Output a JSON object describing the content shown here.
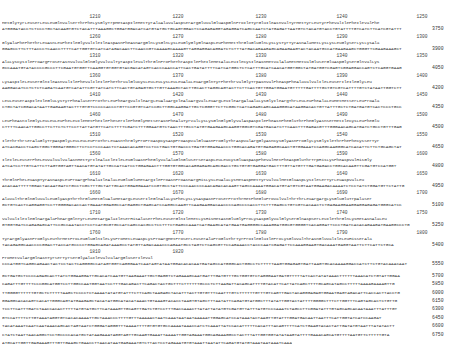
{
  "document": {
    "type": "nucleotide-and-deduced-amino-acid-sequence",
    "coding_blocks": [
      {
        "ruler": [
          "1210",
          "1220",
          "1230",
          "1240",
          "1250"
        ],
        "aa": "MetGlyTyrLeuSerLeuLeuGlnValSerThrPheLysGlyTrpMetAspIleMetTyrAlaAlaValAspSerArgGluValGluAspGlnProIleTyrGluIleAsnValTyrMetTyrLeuTyrPheValIlePheIleValPhe",
        "nt": "ATGGGATACCTCTCCCTGCTACAAGTGTCTACATTTAAAGGCTGGATGGACATCATGTATGCTGCAGTGGACTCCAGAGAGGTAGAGGATCAGCCAATCTATGAGATTAATGTCTACATGTACCTGTATTTTGTCATCTTCATCGTATTT",
        "end": "3750"
      },
      {
        "ruler": [
          "1260",
          "1270",
          "1280",
          "1290",
          "1300"
        ],
        "aa": "GlyAlaPhePheThrLeuAsnLeuPheIleGlyValIleIleAspAsnPheAsnArgGlnLysGlnLysLeuGlyGlyGlnAspLeuPheMetThrGluGluGlnLysLysTyrTyrAsnAlaMetLysLysLeuGlySerLysLysAla",
        "nt": "GGAGCCTTCTTTACCCTCAACCTTTTCATTGGTGTCATCATAGACAACTTCAACCGTCAAAAGCAAAAGTTAGGAGGACAGGATCTCTTTATGACAGAAGAGCAGAAGAAGTACTACAATGCCATGAAGAAGCTGGGTTCGAAGAAAGCT",
        "end": "3900"
      },
      {
        "ruler": [
          "1310",
          "1320",
          "1330",
          "1340",
          "1350"
        ],
        "aa": "AlaLysCysIleProArgProSerAsnValValGlnGlyValValTyrAspIleValThrGlnProPheThrAspIlePheIleMetAlaLeuIleCysIleAsnMetValAlaMetMetValGluSerGluAspGlySerGlnValLys",
        "nt": "GCCAAATGTATACCCCGCCCTTCGAATGTGGTTCAAGGTGTGGTGTACGACATAGTCACCCAACCATTCACTGATATTTTCATCATGGCTCTCATTTGCATCAACATGGTGGCTATGATGGTCGAGTCGGAGGACCAGTCTCAGGTGAAG",
        "end": "4050"
      },
      {
        "ruler": [
          "1360",
          "1370",
          "1380",
          "1390",
          "1400"
        ],
        "aa": "LysAspIleLeuSerGlnIleAsnValIlePheValIleIlePheThrValGluCysLeuLeuLysLeuLeuAlaLeuArgGlnTyrPheThrValGlyTrpAsnValPheAspPheAlaValValIleLeuSerIleIleGlyLeu",
        "nt": "AAGGACATCCTCTCTCAGATCAATGTCATATTCGTTATCATCTTCACTGTAGAGTGCTTGTTAAAGCTACTTGCACTTAGGCAGTACTTCTTCACTGTTGGATGGAATGTTTTTGATTTTGCTGTCGTCATTTTGTCTATAATTGGTCTT",
        "end": "4200"
      },
      {
        "ruler": [
          "1410",
          "1420",
          "1430",
          "1440",
          "1450"
        ],
        "aa": "LeuLeuSerAspIleIleGluLysTyrPheAlaSerProThrLeuPheArgValIleArgLeuAlaArgIleAlaArgValLeuArgLeuIleArgAlaAlaLysGlyIleArgThrLeuLeuPheAlaLeuMetMetSerLeuProAla",
        "nt": "CTGCTATCGGACATAATTGAGAAGTACTTTGTGTCCCCCACCCTGTTCCGTGTCATCCGCTTGGCAAGGATTGCTCGGGTTCTTCGGCTCATCAGAGCAGCAAAGGGCATAAGGACACTGTTATTTGCTCTGATGATGTCACTCCCTGCC",
        "end": "4350"
      },
      {
        "ruler": [
          "1460",
          "1470",
          "1480",
          "1490",
          "1500"
        ],
        "aa": "LeuPheAsnIleGlyLeuLeuLeuPheLeuIleMetPheIlePheSerIlePheGlyMetSerAsnPheAlaTyrValLysLysGlnGlyGlyValAspAspIlePheAsnPheGluThrPheGlyAsnSerMetIleCysLeuPheGlu",
        "nt": "CTTTTCAACATTGGCCTTCTTCTCTTCCTTATTATGTTCATCTTTTCGATCTTTGGAATGTCTAACTTTGCCTATGTGAAGAAGCAAGGTGGCGTCGATGACATCTTCAACTTTGAGACGTTTGGGAACAGCATGATCTGCCTGTTTGAG",
        "end": "4500"
      },
      {
        "ruler": [
          "1510",
          "1520",
          "1530",
          "1540",
          "1550"
        ],
        "aa": "IleThrThrSerAlaGlyTrpAspGlyLeuLeuLeuProThrLeuAsnThrGlyProProAspCysAspProAspValGluAsnProGlyThrAspValArgGlyAsnCysGlyAsnProGlyLysGlyIleThrPhePheCysSerTyr",
        "nt": "ATCACGACCTCAGCTGGCTGGGATGGGCTTCTCCTCCCAACTCTAAACACAGGTCCTCCTGACTGTGACCCTGATGTGGAGAACCCTGGCACAGATGTGAGAGGCAACTGTGGAAATCCAGGCAAGGGCATCACATTCTTCTGCAGCTAT",
        "end": "4650"
      },
      {
        "ruler": [
          "1560",
          "1570",
          "1580",
          "1590",
          "1600"
        ],
        "aa": "IleIleLeuSerPheLeuValValValAsnMetTyrIleAlaIleIleLeuGluAsnPheGlyValAlaGlnGluSerSerAspLeuLeuCysGluAspAspPheValMetPheAspGluThrTrpHisLysPheAspValHisGly",
        "nt": "ATCATCCTTGTCATTCTTAGTGGTAGTTAACATGTATATTGCCATCATCCTGGAGAACTTTGGTGTGGCACAGGAGAGCAGCGACCTGCTGTGTGAGGATGACTTTGTTATGTTTGATGAGACCTGGCACAAGTTCGATGTCCATGGT",
        "end": "4800"
      },
      {
        "ruler": [
          "1610",
          "1620",
          "1630",
          "1640",
          "1650"
        ],
        "aa": "ThrGlnPheLeuAspTyrAsnAspLeuProArgPheAlaIleAlaLeuGluGluMetArgIleProAsnProAsnArgHisLysLeuAlaLysMetAspMetTyrValValMetGluAspLysIleSerTyrLeuAspValLeu",
        "nt": "ACACAATTTTTGGACTACAATGATCTGCCTCGCTTTGCTATTGCACTGGAGGAAATCCGTGCCTATTCCCAACCCCAACAGACACAAGTTAGCCAAAATGGACATGTATGTCGTAATGGAAGACAAAATCTCCTATCTGGATGTTCTATTG",
        "end": "4950"
      },
      {
        "ruler": [
          "1660",
          "1670",
          "1680",
          "1690",
          "1700"
        ],
        "aa": "AlaValThrGlnGluValLeuGlyAspThrThrGluMetGluAlaMetArgLeuSerIleGlnAlaLysPheLysLysAspAsnProSerProThrMetPheGluProValValThrThrLeuArgArgLysGluGluTrpAlaSer",
        "nt": "GCTGTCACTCAGGAGGTCCTTGGGGACACCACTGAAATGGAGGCCATGAGGCTGAGCATCCAGGCCAAGTTCAAGAAGGACAACCCCAGCCCCACCTTCTTTGAGCCTGTCGTCACAACTCTGAGAAGGAAGGAGGAGAGATGGGCATCC",
        "end": "5100"
      },
      {
        "ruler": [
          "1710",
          "1720",
          "1730",
          "1740",
          "1750"
        ],
        "aa": "ValValIleIleGlnArgAlaPheArgGlnTyrLeuMetArgAlaIleSerHisAlaSerPheLeuSerGlnIleMetLysHisMetAsnGluGlyProLysAspGlyValGlySerGlnAspSerLeuIleThrGlnLysMetAsnAlaLeu",
        "nt": "GTGGTGATCCAGAGAGCATTCCGCCAATACCTCCTCATGCGTGCCATCAGCCACGCCTCCTTTCTGAGCCAAATCATGAAGCATATGAATGAGGGGCCAAAGGATGGCGTGGGGTCACAGGATTCCCTGATCACACAGAAGATGAAGGCCCTG",
        "end": "5250"
      },
      {
        "ruler": [
          "1760",
          "1770",
          "1780",
          "1790",
          "1800"
        ],
        "aa": "TyrArgGlyAsnProGlyLeuThrMetProLeuGluGlnIleLysProMetLeuAspLysProArgMetProSerLeuSerAlaProGluThrTyrProIleGluIleProLysGluValThrAsnGluValIleLeuHisSerAla",
        "nt": "TACAGAGGCAACCCCGGACTTACCATGCCCCTGGAGCAGATAAAGCCTATGTTAGACAAACCCAGAATGCCTAGTCTCAGCGTTCCAGAAACCTACCCAATCGAGATTCCAAAGGAAGTGACAAATGAGGTAATTCTTCATTCTGCA",
        "end": "5400"
      },
      {
        "ruler": [
          "1810",
          "1820",
          "",
          "",
          ""
        ],
        "aa": "ProMetValArgGlnAsnTyrSerTyrSerGlyAlaIleValValArgGluSerIleVal",
        "nt": "CCCATGGTCAGGCAGAACTACTCCTACTCAGGGGCCATAGTGGTCAGGGAATCAATAGTATAATGGACACACAATGATAGCCATGGGCACTGGCCTCTTTTTAAGTGGAGAGTGATTAAGTGCACAAAAGGACCATCTTCTGTACAAACAAT",
        "end": "5550"
      }
    ],
    "utr_lines": [
      {
        "nt": "GCTGATGCTCCCCAGAGCACTTATCTGGAAGGATTGCACATCAATGTTAAGAAATTGCTGAGGTCTAGAAAGCAATGATTTGATGTTTGCTGGTGTCTAGGGAATGATGTTTTTATCACTATATAAACTTTTTTAAACATCTGTATTGGAA",
        "end": "5700"
      },
      {
        "nt": "CAGATTTGTTTTCCCGGCATGGTCCTTGGCCAATGGTAATCCTTTGACAGACTTCAGACTACTGCTTTCTTTTTTGCCCTCTTAAGATTACAGCATTTTGTACATTCATTATCAGCTTTTGCAGCATAGCCTTTTTAAAAGAAAAGTTG",
        "end": "5850"
      },
      {
        "nt": "TTGGGGTTTTTTGTGCTCTTTTTAAGCTCCCCTCTAAAATATATGTATTTCTTCAGCTAAGAGCTACATTTACTTGTGTTTCAATTTGTCTTTTTTGTTTGTCAGTTGACTACAGGGAGAGTGGAATGAGTAGACATTCACCACTTACCTG",
        "end": "6000"
      },
      {
        "nt": "GGAGGCACACAGTCACATTGGGCAGTATGAAGAGCTACATATGGCATACATAAACTGTAAAGTACACCTAAGTGTAGCTTTAATATTCAGATGTATGGCTTTATATTGGTACTATTTTGGGGCTTTCTTGGTTTCAGTAGCACTCTGTTG",
        "end": "6150"
      },
      {
        "nt": "TCCTTCATTTGATCTAACCACACTTTTTATGTATGCTTCATAAAGTTGCAGTTGATCTGTCCTTTGACCAAACTTATATTATATGTCGATGTTATTTATGTCCCAAATCTAGCCTTCGGATATTTGTAGCAGCACAATAAATTTATTTGT",
        "end": "6300"
      },
      {
        "nt": "GTCCATTTTCTTGTAAATAGGTGTCACACAAAATTGCTAAACCCTTTTGTTTAAAAACTAATCAAATAATAATAAAAATTGGAGCATCCATAAATACTAAGTTGTATTTGGATGACAATTAATTTCATTGGTATCATCCAAGAT",
        "end": "6450"
      },
      {
        "nt": "TACATAAATCAATCAATAAACAGCACTAGTAATCTGGGATAGGGTTTAAAATTTTGTGTGTGCCAAAATAAACCATCTCAAATTATCCACATTTTTCACATTTACAGTTTTCATCTGAAGTACACTATTGATATGTAATTTATATACTT",
        "end": "6600"
      },
      {
        "nt": "CTATCTAATTAACAGGCTCCTGCCCCACATGCTATAAGAAATAGGTAGTTGCAAGTGAAATTAAAATTGGTAGAAATGGCAGAAAGGCCTACTTTATTGGTGGTATATAAGTATTTTGAAACAGCATGTTTTAATGTTCTTTTTGTA",
        "end": "6750"
      }
    ],
    "tail_line": "ATGCATTGGTTGAGAAAGTTTGTTGAAGCTGAACCTTAACATAATGAGAAATGTCTTACTCCTAGAAATGTGTAAATTAATATTCAGATGTATGTAAATAATAAATCAAACATTT......3'"
  }
}
